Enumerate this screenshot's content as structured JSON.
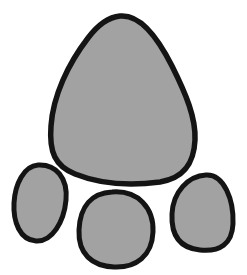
{
  "illustration": {
    "subject": "paw-print",
    "colors": {
      "background": "#ffffff",
      "pad_fill": "#a2a2a2",
      "outline": "#141414"
    },
    "pads": [
      {
        "name": "main-pad"
      },
      {
        "name": "toe-pad-left"
      },
      {
        "name": "toe-pad-middle"
      },
      {
        "name": "toe-pad-right"
      }
    ]
  }
}
